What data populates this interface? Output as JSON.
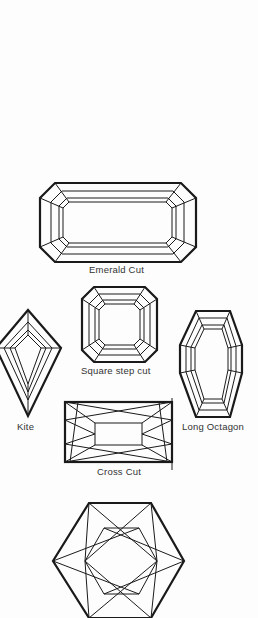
{
  "diagram": {
    "ink_color": "#1a1a1a",
    "label_color": "#333333",
    "background": "#fdfdfd",
    "shapes": [
      {
        "id": "emerald-cut",
        "label": "Emerald Cut"
      },
      {
        "id": "kite",
        "label": "Kite"
      },
      {
        "id": "square-step-cut",
        "label": "Square step cut"
      },
      {
        "id": "long-octagon",
        "label": "Long Octagon"
      },
      {
        "id": "cross-cut",
        "label": "Cross Cut"
      },
      {
        "id": "hexagon-cut",
        "label": ""
      }
    ]
  }
}
